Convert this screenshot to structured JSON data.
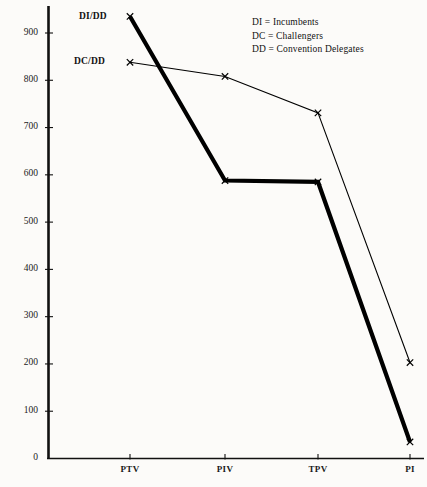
{
  "chart_data": {
    "type": "line",
    "title": "",
    "subtitle": "",
    "xlabel": "",
    "ylabel": "",
    "categories": [
      "PTV",
      "PIV",
      "TPV",
      "PI"
    ],
    "ylim": [
      0,
      940
    ],
    "yticks": [
      0,
      100,
      200,
      300,
      400,
      500,
      600,
      700,
      800,
      900
    ],
    "ytick_labels": [
      "0",
      "100",
      "200",
      "300",
      "400",
      "500",
      "600",
      "700",
      "800",
      "900"
    ],
    "grid": false,
    "legend_position": "top-right",
    "marker": "x",
    "series": [
      {
        "name": "DI/DD",
        "label": "DI/DD",
        "values": [
          935,
          588,
          585,
          35
        ],
        "color": "#000000",
        "line_width": 4.2,
        "style": "thick"
      },
      {
        "name": "DC/DD",
        "label": "DC/DD",
        "values": [
          838,
          808,
          731,
          203
        ],
        "color": "#000000",
        "line_width": 1.1,
        "style": "thin"
      }
    ],
    "legend": [
      "DI = Incumbents",
      "DC = Challengers",
      "DD = Convention  Delegates"
    ],
    "axis_color": "#111111",
    "background_color": "#fcfbf9"
  }
}
